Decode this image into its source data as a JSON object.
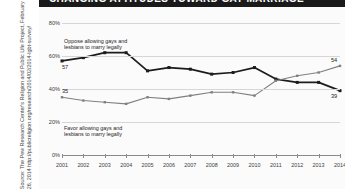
{
  "title": "CHANGING ATTITUDES TOWARD GAY MARRIAGE",
  "source_note": "Source: The Pew Research Center's Religion and Public Life Project, February 26, 2014 http://publicreligion.org/research/2014/02/2014-lgbt-survey/",
  "axis": {
    "y_ticks": [
      "0%",
      "20%",
      "40%",
      "60%",
      "80%"
    ],
    "x_ticks": [
      "2001",
      "2002",
      "2003",
      "2004",
      "2005",
      "2006",
      "2007",
      "2008",
      "2009",
      "2010",
      "2011",
      "2012",
      "2013",
      "2014"
    ]
  },
  "annotations": {
    "oppose": "Oppose allowing gays and\nlesbians to marry legally",
    "favor": "Favor allowing gays and\nlesbians to marry legally"
  },
  "endpoint_labels": {
    "oppose_start": "57",
    "oppose_end": "39",
    "favor_start": "35",
    "favor_end": "54"
  },
  "colors": {
    "oppose_line": "#1c1c1c",
    "favor_line": "#808080",
    "grid": "#d6d6d6",
    "panel": "#fbfbfb",
    "titlebar": "#1a1a1a"
  },
  "chart_data": {
    "type": "line",
    "title": "CHANGING ATTITUDES TOWARD GAY MARRIAGE",
    "xlabel": "",
    "ylabel": "",
    "ylim": [
      0,
      80
    ],
    "grid": true,
    "legend": "inline-annotations",
    "categories": [
      "2001",
      "2002",
      "2003",
      "2004",
      "2005",
      "2006",
      "2007",
      "2008",
      "2009",
      "2010",
      "2011",
      "2012",
      "2013",
      "2014"
    ],
    "series": [
      {
        "name": "Oppose allowing gays and lesbians to marry legally",
        "color": "#1c1c1c",
        "values": [
          57,
          59,
          62,
          62,
          51,
          53,
          52,
          49,
          50,
          53,
          46,
          44,
          44,
          39
        ]
      },
      {
        "name": "Favor allowing gays and lesbians to marry legally",
        "color": "#808080",
        "values": [
          35,
          33,
          32,
          31,
          35,
          34,
          36,
          38,
          38,
          36,
          45,
          48,
          50,
          54
        ]
      }
    ]
  }
}
